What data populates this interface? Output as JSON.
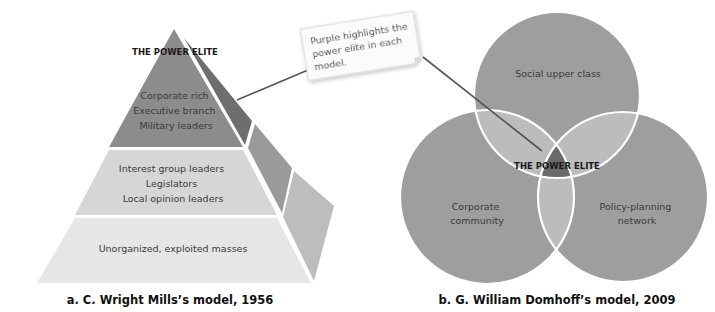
{
  "callout": {
    "lines": [
      "Purple highlights the",
      "power elite in each",
      "model."
    ]
  },
  "mills": {
    "apex_label": "THE POWER ELITE",
    "tiers": [
      {
        "lines": [
          "Corporate rich",
          "Executive branch",
          "Military leaders"
        ]
      },
      {
        "lines": [
          "Interest group leaders",
          "Legislators",
          "Local opinion leaders"
        ]
      },
      {
        "lines": [
          "Unorganized, exploited masses"
        ]
      }
    ],
    "caption": "a. C. Wright Mills’s model, 1956"
  },
  "domhoff": {
    "circles": [
      {
        "lines": [
          "Social upper class"
        ]
      },
      {
        "lines": [
          "Corporate",
          "community"
        ]
      },
      {
        "lines": [
          "Policy-planning",
          "network"
        ]
      }
    ],
    "center_label": "THE POWER ELITE",
    "caption": "b. G. William Domhoff’s model, 2009"
  },
  "colors": {
    "elite": "#8c8c8c",
    "elite_side": "#6e6e6e",
    "middle": "#d6d6d6",
    "middle_side": "#9a9a9a",
    "bottom": "#e6e6e6",
    "bottom_side": "#bdbdbd",
    "venn_circle": "#9e9e9e",
    "venn_overlap": "#bcbcbc",
    "venn_center": "#6a6a6a"
  }
}
